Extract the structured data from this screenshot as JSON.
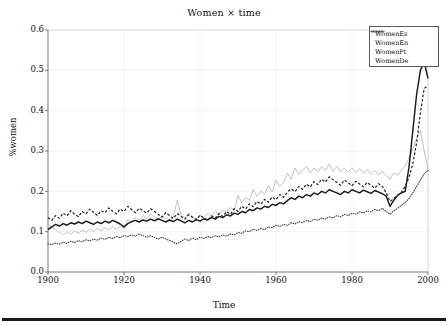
{
  "figure": {
    "title": "Women × time",
    "xlabel": "Time",
    "ylabel": "%women"
  },
  "legend": {
    "entries": [
      {
        "label": "WomenEs",
        "style": "dashed",
        "color": "#1a1a1a"
      },
      {
        "label": "WomenEn",
        "style": "solid-bold",
        "color": "#1a1a1a"
      },
      {
        "label": "WomenPt",
        "style": "solid-light",
        "color": "#b3b3b3"
      },
      {
        "label": "WomenDe",
        "style": "dotted",
        "color": "#3a3a3a"
      }
    ]
  },
  "axes": {
    "y_ticks": [
      "0.6",
      "0.5",
      "0.4",
      "0.3",
      "0.2",
      "0.1",
      "0.0"
    ],
    "x_ticks": [
      "1900",
      "1920",
      "1940",
      "1960",
      "1980",
      "2000"
    ]
  },
  "chart_data": {
    "type": "line",
    "title": "Women × time",
    "xlabel": "Time",
    "ylabel": "%women",
    "xlim": [
      1900,
      2000
    ],
    "ylim": [
      0.0,
      0.6
    ],
    "xticks": [
      1900,
      1920,
      1940,
      1960,
      1980,
      2000
    ],
    "yticks": [
      0.0,
      0.1,
      0.2,
      0.3,
      0.4,
      0.5,
      0.6
    ],
    "grid": true,
    "legend_position": "upper-right",
    "x": [
      1900,
      1901,
      1902,
      1903,
      1904,
      1905,
      1906,
      1907,
      1908,
      1909,
      1910,
      1911,
      1912,
      1913,
      1914,
      1915,
      1916,
      1917,
      1918,
      1919,
      1920,
      1921,
      1922,
      1923,
      1924,
      1925,
      1926,
      1927,
      1928,
      1929,
      1930,
      1931,
      1932,
      1933,
      1934,
      1935,
      1936,
      1937,
      1938,
      1939,
      1940,
      1941,
      1942,
      1943,
      1944,
      1945,
      1946,
      1947,
      1948,
      1949,
      1950,
      1951,
      1952,
      1953,
      1954,
      1955,
      1956,
      1957,
      1958,
      1959,
      1960,
      1961,
      1962,
      1963,
      1964,
      1965,
      1966,
      1967,
      1968,
      1969,
      1970,
      1971,
      1972,
      1973,
      1974,
      1975,
      1976,
      1977,
      1978,
      1979,
      1980,
      1981,
      1982,
      1983,
      1984,
      1985,
      1986,
      1987,
      1988,
      1989,
      1990,
      1991,
      1992,
      1993,
      1994,
      1995,
      1996,
      1997,
      1998,
      1999,
      2000
    ],
    "series": [
      {
        "name": "WomenEs",
        "style": "dashed",
        "color": "#1a1a1a",
        "values": [
          0.135,
          0.128,
          0.14,
          0.133,
          0.146,
          0.139,
          0.152,
          0.143,
          0.137,
          0.15,
          0.144,
          0.156,
          0.148,
          0.14,
          0.152,
          0.147,
          0.159,
          0.151,
          0.144,
          0.156,
          0.15,
          0.163,
          0.155,
          0.147,
          0.158,
          0.152,
          0.146,
          0.157,
          0.15,
          0.143,
          0.136,
          0.147,
          0.14,
          0.133,
          0.145,
          0.138,
          0.131,
          0.142,
          0.136,
          0.13,
          0.141,
          0.134,
          0.128,
          0.139,
          0.133,
          0.145,
          0.138,
          0.15,
          0.143,
          0.157,
          0.15,
          0.163,
          0.156,
          0.169,
          0.162,
          0.175,
          0.168,
          0.18,
          0.173,
          0.186,
          0.179,
          0.192,
          0.185,
          0.198,
          0.206,
          0.199,
          0.212,
          0.205,
          0.218,
          0.211,
          0.224,
          0.217,
          0.23,
          0.223,
          0.236,
          0.229,
          0.222,
          0.215,
          0.228,
          0.221,
          0.214,
          0.225,
          0.218,
          0.211,
          0.222,
          0.215,
          0.208,
          0.219,
          0.212,
          0.196,
          0.175,
          0.182,
          0.19,
          0.198,
          0.212,
          0.235,
          0.268,
          0.32,
          0.395,
          0.455,
          0.462
        ]
      },
      {
        "name": "WomenEn",
        "style": "solid-bold",
        "color": "#1a1a1a",
        "values": [
          0.105,
          0.112,
          0.118,
          0.114,
          0.12,
          0.116,
          0.122,
          0.119,
          0.124,
          0.12,
          0.126,
          0.122,
          0.118,
          0.124,
          0.12,
          0.126,
          0.122,
          0.128,
          0.124,
          0.119,
          0.112,
          0.12,
          0.125,
          0.128,
          0.124,
          0.129,
          0.126,
          0.131,
          0.127,
          0.132,
          0.128,
          0.124,
          0.129,
          0.125,
          0.131,
          0.127,
          0.122,
          0.128,
          0.124,
          0.13,
          0.126,
          0.132,
          0.129,
          0.135,
          0.131,
          0.138,
          0.135,
          0.142,
          0.139,
          0.146,
          0.143,
          0.15,
          0.147,
          0.155,
          0.152,
          0.159,
          0.156,
          0.163,
          0.16,
          0.168,
          0.165,
          0.172,
          0.169,
          0.177,
          0.184,
          0.18,
          0.188,
          0.184,
          0.192,
          0.188,
          0.196,
          0.192,
          0.2,
          0.196,
          0.204,
          0.2,
          0.196,
          0.192,
          0.2,
          0.196,
          0.204,
          0.2,
          0.196,
          0.203,
          0.199,
          0.195,
          0.202,
          0.198,
          0.194,
          0.188,
          0.163,
          0.178,
          0.19,
          0.196,
          0.2,
          0.26,
          0.35,
          0.44,
          0.5,
          0.52,
          0.48
        ]
      },
      {
        "name": "WomenPt",
        "style": "solid-light",
        "color": "#b3b3b3",
        "values": [
          0.12,
          0.112,
          0.105,
          0.098,
          0.092,
          0.1,
          0.094,
          0.102,
          0.096,
          0.104,
          0.098,
          0.106,
          0.1,
          0.108,
          0.102,
          0.11,
          0.104,
          0.112,
          0.106,
          0.114,
          0.108,
          0.13,
          0.122,
          0.136,
          0.128,
          0.14,
          0.132,
          0.144,
          0.136,
          0.128,
          0.14,
          0.132,
          0.125,
          0.137,
          0.178,
          0.142,
          0.134,
          0.146,
          0.138,
          0.13,
          0.142,
          0.134,
          0.146,
          0.138,
          0.15,
          0.142,
          0.155,
          0.148,
          0.16,
          0.153,
          0.19,
          0.172,
          0.184,
          0.178,
          0.205,
          0.188,
          0.2,
          0.193,
          0.215,
          0.198,
          0.228,
          0.212,
          0.222,
          0.245,
          0.23,
          0.258,
          0.242,
          0.252,
          0.262,
          0.246,
          0.258,
          0.248,
          0.262,
          0.252,
          0.268,
          0.25,
          0.262,
          0.248,
          0.258,
          0.248,
          0.258,
          0.246,
          0.256,
          0.244,
          0.254,
          0.242,
          0.252,
          0.24,
          0.25,
          0.238,
          0.23,
          0.246,
          0.24,
          0.252,
          0.262,
          0.282,
          0.305,
          0.33,
          0.35,
          0.3,
          0.255
        ]
      },
      {
        "name": "WomenDe",
        "style": "dotted",
        "color": "#3a3a3a",
        "values": [
          0.07,
          0.068,
          0.072,
          0.069,
          0.074,
          0.071,
          0.076,
          0.073,
          0.078,
          0.075,
          0.08,
          0.077,
          0.082,
          0.079,
          0.084,
          0.081,
          0.086,
          0.083,
          0.088,
          0.085,
          0.09,
          0.088,
          0.092,
          0.089,
          0.094,
          0.09,
          0.086,
          0.09,
          0.086,
          0.082,
          0.086,
          0.082,
          0.078,
          0.074,
          0.07,
          0.076,
          0.082,
          0.078,
          0.084,
          0.08,
          0.086,
          0.083,
          0.088,
          0.085,
          0.09,
          0.087,
          0.092,
          0.089,
          0.094,
          0.092,
          0.098,
          0.096,
          0.102,
          0.1,
          0.106,
          0.103,
          0.108,
          0.105,
          0.112,
          0.11,
          0.116,
          0.113,
          0.118,
          0.116,
          0.122,
          0.119,
          0.125,
          0.122,
          0.128,
          0.125,
          0.131,
          0.128,
          0.134,
          0.131,
          0.137,
          0.134,
          0.14,
          0.137,
          0.143,
          0.14,
          0.146,
          0.143,
          0.149,
          0.146,
          0.152,
          0.149,
          0.155,
          0.152,
          0.158,
          0.15,
          0.143,
          0.152,
          0.158,
          0.165,
          0.172,
          0.182,
          0.196,
          0.212,
          0.228,
          0.244,
          0.252
        ]
      }
    ]
  }
}
